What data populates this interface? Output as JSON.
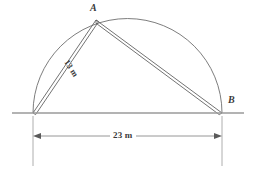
{
  "figure": {
    "type": "geometry-diagram",
    "background_color": "#ffffff",
    "stroke_color": "#5a5a5a",
    "ground_line_color": "#8c8c8c",
    "text_color": "#3a3a3a",
    "vertices": {
      "apex_label": "A",
      "right_base_label": "B"
    },
    "measurements": {
      "strut_length_label": "13 m",
      "span_label": "23 m"
    },
    "geometry": {
      "ground_y": 113,
      "ground_x_start": 12,
      "ground_x_end": 244,
      "left_base_x": 33,
      "right_base_x": 222,
      "apex_x": 96,
      "apex_y": 20,
      "arc_center_x": 127.5,
      "arc_radius": 94.5,
      "arc_top_y": 13,
      "dimension_line_y": 136,
      "extension_line_bottom_y": 166
    },
    "elements": {
      "arc_name": "semicircular-arc",
      "left_strut_name": "strut-left-13m",
      "right_strut_name": "strut-right",
      "ground_name": "ground-line",
      "dimension_name": "span-dimension-23m"
    }
  }
}
